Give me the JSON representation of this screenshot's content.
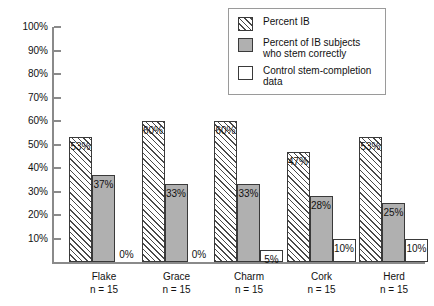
{
  "chart_data": {
    "type": "bar",
    "title": "",
    "xlabel": "",
    "ylabel": "",
    "ylim": [
      0,
      100
    ],
    "grid": false,
    "legend_position": "top-right",
    "categories": [
      "Flake",
      "Grace",
      "Charm",
      "Cork",
      "Herd"
    ],
    "category_sublabels": [
      "n = 15",
      "n = 15",
      "n = 15",
      "n = 15",
      "n = 15"
    ],
    "y_ticks": [
      "10%",
      "20%",
      "30%",
      "40%",
      "50%",
      "60%",
      "70%",
      "80%",
      "90%",
      "100%"
    ],
    "y_tick_values": [
      10,
      20,
      30,
      40,
      50,
      60,
      70,
      80,
      90,
      100
    ],
    "series": [
      {
        "name": "Percent IB",
        "style": "hatched",
        "values": [
          53,
          60,
          60,
          47,
          53
        ],
        "labels": [
          "53%",
          "60%",
          "60%",
          "47%",
          "53%"
        ]
      },
      {
        "name": "Percent of IB subjects who stem correctly",
        "style": "gray",
        "values": [
          37,
          33,
          33,
          28,
          25
        ],
        "labels": [
          "37%",
          "33%",
          "33%",
          "28%",
          "25%"
        ]
      },
      {
        "name": "Control stem-completion data",
        "style": "white",
        "values": [
          0,
          0,
          5,
          10,
          10
        ],
        "labels": [
          "0%",
          "0%",
          "5%",
          "10%",
          "10%"
        ]
      }
    ]
  },
  "legend": {
    "items": [
      {
        "label": "Percent IB",
        "style": "hatched"
      },
      {
        "label": "Percent of IB subjects\nwho stem correctly",
        "style": "gray"
      },
      {
        "label": "Control stem-completion\ndata",
        "style": "white"
      }
    ]
  },
  "colors": {
    "hatch_line": "#4a4a4a",
    "gray_fill": "#b0b0b0",
    "white_fill": "#ffffff",
    "bar_border": "#3a3a3a",
    "axis": "#8a8a8a",
    "text": "#111111",
    "legend_border": "#9a9a9a"
  }
}
